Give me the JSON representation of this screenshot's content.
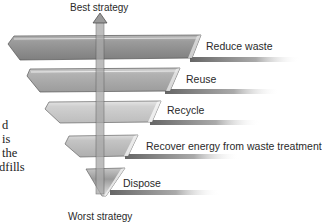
{
  "diagram": {
    "top_label": "Best strategy",
    "bottom_label": "Worst strategy",
    "tiers": [
      {
        "label": "Reduce waste",
        "color": "#8f8f8f"
      },
      {
        "label": "Reuse",
        "color": "#a9a9a9"
      },
      {
        "label": "Recycle",
        "color": "#c4c4c4"
      },
      {
        "label": "Recover energy from waste treatment",
        "color": "#b4b4b4"
      },
      {
        "label": "Dispose",
        "color": "#9a9a9a"
      }
    ],
    "arrow_color": "#9c9c9c"
  },
  "side_text": {
    "lines": [
      "d",
      "is",
      "the",
      "dfills"
    ]
  }
}
